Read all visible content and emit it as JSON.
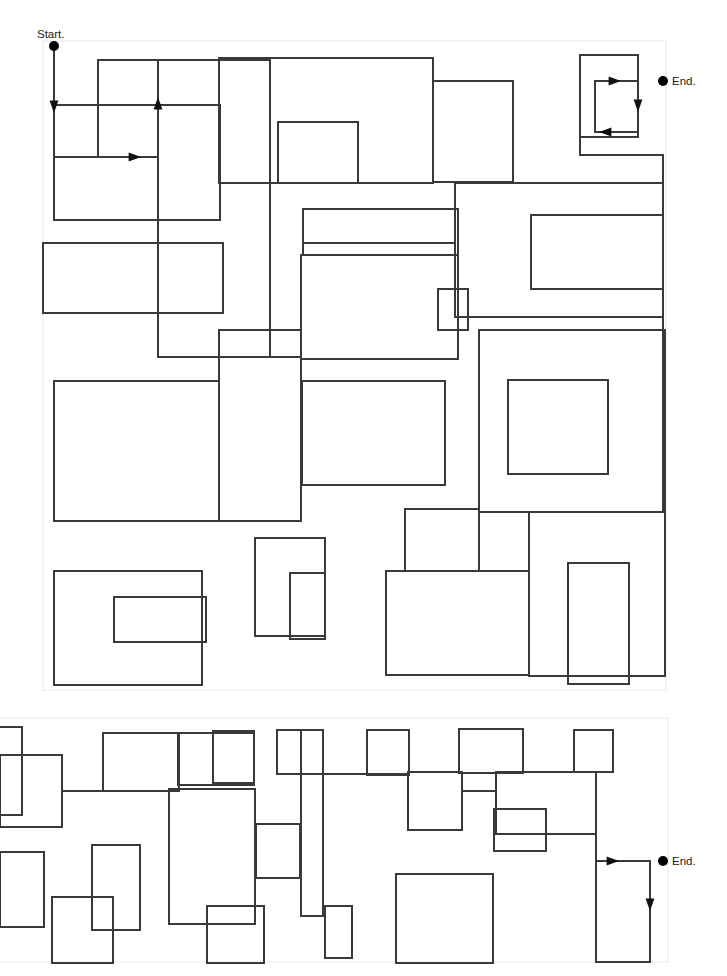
{
  "canvas": {
    "width": 727,
    "height": 976,
    "background": "#ffffff"
  },
  "style": {
    "maze_line_color": "#3a3a3a",
    "maze_line_width": 1.4,
    "panel_border_color": "#e8e8e8",
    "panel_border_width": 1,
    "marker_color": "#000000",
    "marker_radius": 5,
    "arrow_color": "#111111",
    "label_color": "#1a1a1a",
    "label_font_size": 11.5
  },
  "labels": {
    "start": "Start.",
    "end_top": "End.",
    "end_bottom": "End."
  },
  "panels": [
    {
      "name": "maze-panel-top",
      "x": 43,
      "y": 41,
      "width": 623,
      "height": 649
    },
    {
      "name": "maze-panel-bottom",
      "x": -38,
      "y": 718,
      "width": 706,
      "height": 244
    }
  ],
  "markers": [
    {
      "name": "start-marker",
      "x": 54,
      "y": 46,
      "label": "Start.",
      "label_x": 37,
      "label_y": 38,
      "label_anchor": "start"
    },
    {
      "name": "end-marker-top",
      "x": 663,
      "y": 81,
      "label": "End.",
      "label_x": 672,
      "label_y": 85,
      "label_anchor": "start"
    },
    {
      "name": "end-marker-bottom",
      "x": 663,
      "y": 861,
      "label": "End.",
      "label_x": 672,
      "label_y": 865,
      "label_anchor": "start"
    }
  ],
  "arrows": [
    {
      "name": "arrow-start-down",
      "x": 54,
      "y": 105,
      "dir": "down"
    },
    {
      "name": "arrow-loop1-up",
      "x": 158,
      "y": 105,
      "dir": "up"
    },
    {
      "name": "arrow-loop1-right",
      "x": 133,
      "y": 157,
      "dir": "right"
    },
    {
      "name": "arrow-end-top-in",
      "x": 613,
      "y": 81,
      "dir": "right"
    },
    {
      "name": "arrow-end-top-down",
      "x": 638,
      "y": 104,
      "dir": "down"
    },
    {
      "name": "arrow-end-top-left",
      "x": 607,
      "y": 132,
      "dir": "left"
    },
    {
      "name": "arrow-end-bottom-in",
      "x": 611,
      "y": 861,
      "dir": "right"
    },
    {
      "name": "arrow-end-bottom-down",
      "x": 650,
      "y": 903,
      "dir": "down"
    }
  ],
  "maze_top_rects": [
    {
      "x": 98,
      "y": 60,
      "w": 60,
      "h": 97
    },
    {
      "x": 219,
      "y": 58,
      "w": 214,
      "h": 125
    },
    {
      "x": 278,
      "y": 122,
      "w": 80,
      "h": 61
    },
    {
      "x": 433,
      "y": 81,
      "w": 80,
      "h": 101
    },
    {
      "x": 580,
      "y": 55,
      "w": 58,
      "h": 82
    },
    {
      "x": 595,
      "y": 81,
      "w": 43,
      "h": 51
    },
    {
      "x": 54,
      "y": 105,
      "w": 166,
      "h": 115
    },
    {
      "x": 158,
      "y": 60,
      "w": 112,
      "h": 297
    },
    {
      "x": 43,
      "y": 243,
      "w": 180,
      "h": 70
    },
    {
      "x": 303,
      "y": 209,
      "w": 155,
      "h": 46
    },
    {
      "x": 531,
      "y": 215,
      "w": 132,
      "h": 74
    },
    {
      "x": 438,
      "y": 289,
      "w": 30,
      "h": 41
    },
    {
      "x": 455,
      "y": 183,
      "w": 208,
      "h": 134
    },
    {
      "x": 301,
      "y": 255,
      "w": 157,
      "h": 104
    },
    {
      "x": 54,
      "y": 381,
      "w": 165,
      "h": 140
    },
    {
      "x": 219,
      "y": 330,
      "w": 82,
      "h": 191
    },
    {
      "x": 302,
      "y": 381,
      "w": 143,
      "h": 104
    },
    {
      "x": 508,
      "y": 380,
      "w": 100,
      "h": 94
    },
    {
      "x": 479,
      "y": 330,
      "w": 186,
      "h": 182
    },
    {
      "x": 255,
      "y": 538,
      "w": 70,
      "h": 98
    },
    {
      "x": 290,
      "y": 573,
      "w": 35,
      "h": 66
    },
    {
      "x": 405,
      "y": 509,
      "w": 74,
      "h": 62
    },
    {
      "x": 386,
      "y": 571,
      "w": 143,
      "h": 104
    },
    {
      "x": 568,
      "y": 563,
      "w": 61,
      "h": 121
    },
    {
      "x": 54,
      "y": 571,
      "w": 148,
      "h": 114
    },
    {
      "x": 114,
      "y": 597,
      "w": 92,
      "h": 45
    },
    {
      "x": 529,
      "y": 512,
      "w": 136,
      "h": 164
    }
  ],
  "maze_bottom_rects": [
    {
      "x": -38,
      "y": 727,
      "w": 60,
      "h": 88
    },
    {
      "x": 0,
      "y": 755,
      "w": 62,
      "h": 72
    },
    {
      "x": 103,
      "y": 733,
      "w": 76,
      "h": 58
    },
    {
      "x": 213,
      "y": 731,
      "w": 41,
      "h": 52
    },
    {
      "x": 277,
      "y": 730,
      "w": 46,
      "h": 44
    },
    {
      "x": 367,
      "y": 730,
      "w": 42,
      "h": 45
    },
    {
      "x": 459,
      "y": 729,
      "w": 64,
      "h": 44
    },
    {
      "x": 574,
      "y": 730,
      "w": 39,
      "h": 42
    },
    {
      "x": 178,
      "y": 733,
      "w": 76,
      "h": 52
    },
    {
      "x": 301,
      "y": 730,
      "w": 22,
      "h": 186
    },
    {
      "x": 92,
      "y": 845,
      "w": 48,
      "h": 85
    },
    {
      "x": 0,
      "y": 852,
      "w": 44,
      "h": 75
    },
    {
      "x": 256,
      "y": 824,
      "w": 44,
      "h": 54
    },
    {
      "x": 207,
      "y": 906,
      "w": 57,
      "h": 57
    },
    {
      "x": 325,
      "y": 906,
      "w": 27,
      "h": 52
    },
    {
      "x": 494,
      "y": 809,
      "w": 52,
      "h": 42
    },
    {
      "x": 396,
      "y": 874,
      "w": 97,
      "h": 89
    },
    {
      "x": 596,
      "y": 861,
      "w": 54,
      "h": 101
    },
    {
      "x": 408,
      "y": 772,
      "w": 54,
      "h": 58
    },
    {
      "x": 496,
      "y": 772,
      "w": 100,
      "h": 62
    },
    {
      "x": 169,
      "y": 789,
      "w": 86,
      "h": 135
    },
    {
      "x": 52,
      "y": 897,
      "w": 61,
      "h": 66
    }
  ],
  "maze_top_paths": [
    "M54,46 L54,157 L158,157",
    "M158,60 L158,357 L301,357",
    "M219,58 L433,58 L433,81",
    "M580,137 L580,155 L663,155 L663,183",
    "M301,255 L301,359",
    "M455,183 L455,243 L303,243",
    "M663,317 L663,512",
    "M479,330 L479,512 L665,512",
    "M386,675 L529,675",
    "M202,571 L54,571 L54,685 L202,685"
  ],
  "maze_bottom_paths": [
    "M62,791 L178,791",
    "M213,783 L254,783",
    "M323,774 L409,774",
    "M462,791 L496,791",
    "M596,834 L596,962"
  ],
  "meta": {
    "panel_count": 2
  }
}
